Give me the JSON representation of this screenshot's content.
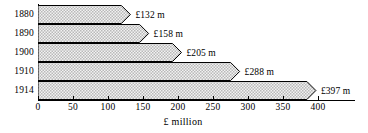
{
  "chart_data": {
    "type": "bar",
    "orientation": "horizontal",
    "title": "",
    "xlabel": "£ million",
    "ylabel": "",
    "categories": [
      "1880",
      "1890",
      "1900",
      "1910",
      "1914"
    ],
    "values": [
      132,
      158,
      205,
      288,
      397
    ],
    "value_labels": [
      "£132 m",
      "£158 m",
      "£205 m",
      "£288 m",
      "£397 m"
    ],
    "xlim": [
      0,
      400
    ],
    "xticks": [
      0,
      50,
      100,
      150,
      200,
      250,
      300,
      350,
      400
    ],
    "xtick_labels": [
      "0",
      "50",
      "100",
      "150",
      "200",
      "250",
      "300",
      "350",
      "400"
    ],
    "grid": false,
    "legend": false,
    "series": [
      {
        "name": "",
        "values": [
          132,
          158,
          205,
          288,
          397
        ]
      }
    ],
    "bar_fill_color": "#e8e8e8",
    "bar_edge_color": "#000000",
    "bar_end_style": "chevron-point",
    "background_color": "#ffffff"
  }
}
